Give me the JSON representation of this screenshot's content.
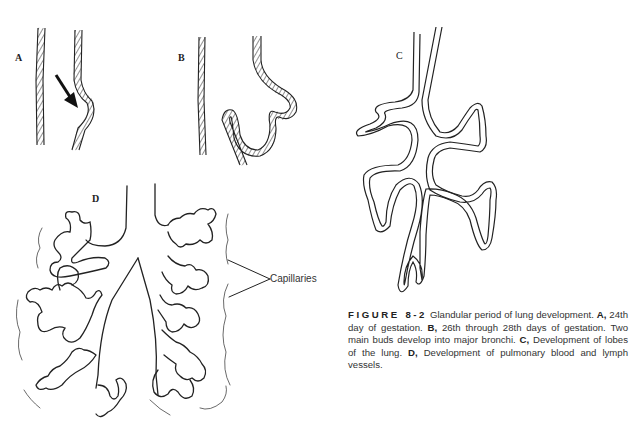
{
  "panels": {
    "a": {
      "label": "A"
    },
    "b": {
      "label": "B"
    },
    "c": {
      "label": "C"
    },
    "d": {
      "label": "D"
    }
  },
  "annotations": {
    "capillaries": "Capillaries"
  },
  "caption": {
    "figure_number": "FIGURE 8-2",
    "title": "Glandular period of lung development.",
    "items": [
      {
        "key": "A,",
        "text": "24th day of gestation."
      },
      {
        "key": "B,",
        "text": "26th through 28th days of gestation. Two main buds develop into major bronchi."
      },
      {
        "key": "C,",
        "text": "Development of lobes of the lung."
      },
      {
        "key": "D,",
        "text": "Development of pulmonary blood and lymph vessels."
      }
    ]
  }
}
